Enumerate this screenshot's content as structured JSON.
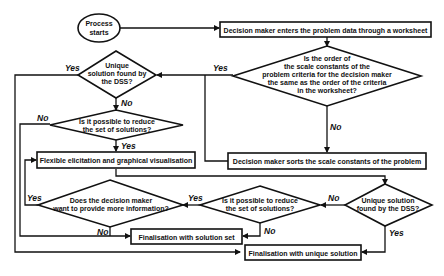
{
  "diagram": {
    "start": {
      "line1": "Process",
      "line2": "starts"
    },
    "box_enter": "Decision maker enters the problem data through a worksheet",
    "dec_order": {
      "lines": [
        "Is the order of",
        "the scale constants of the",
        "problem criteria for the decision maker",
        "the same as the order of the criteria",
        "in the worksheet?"
      ]
    },
    "box_sort": "Decision maker sorts the scale constants of the problem",
    "dec_unique1": {
      "lines": [
        "Unique",
        "solution found by",
        "the DSS?"
      ]
    },
    "dec_reduce1": {
      "lines": [
        "Is it possible to reduce",
        "the set of solutions?"
      ]
    },
    "box_flex": "Flexible elicitation and graphical visualisation",
    "dec_more": {
      "lines": [
        "Does the decision maker",
        "want to provide more information?"
      ]
    },
    "dec_reduce2": {
      "lines": [
        "Is it possible to reduce",
        "the set of solutions?"
      ]
    },
    "dec_unique2": {
      "lines": [
        "Unique solution",
        "found by the DSS?"
      ]
    },
    "box_final_set": "Finalisation with solution set",
    "box_final_unique": "Finalisation with unique solution",
    "labels": {
      "yes": "Yes",
      "no": "No"
    }
  }
}
